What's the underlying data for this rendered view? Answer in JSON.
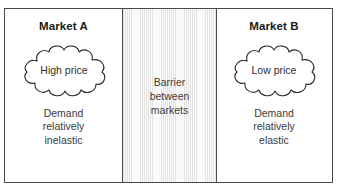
{
  "diagram": {
    "type": "market-separation-diagram",
    "panels": {
      "left": {
        "title": "Market A",
        "cloud_label": "High price",
        "description": {
          "line1": "Demand",
          "line2": "relatively",
          "line3": "inelastic"
        }
      },
      "middle": {
        "line1": "Barrier",
        "line2": "between",
        "line3": "markets"
      },
      "right": {
        "title": "Market B",
        "cloud_label": "Low price",
        "description": {
          "line1": "Demand",
          "line2": "relatively",
          "line3": "elastic"
        }
      }
    },
    "colors": {
      "border": "#4a4a4a",
      "title_text": "#1a1a1a",
      "body_text": "#3a3a3a",
      "barrier_fill": "#f2f2f2",
      "barrier_stripe": "#e3e3e3",
      "cloud_stroke": "#2a2a2a",
      "background": "#ffffff"
    }
  }
}
